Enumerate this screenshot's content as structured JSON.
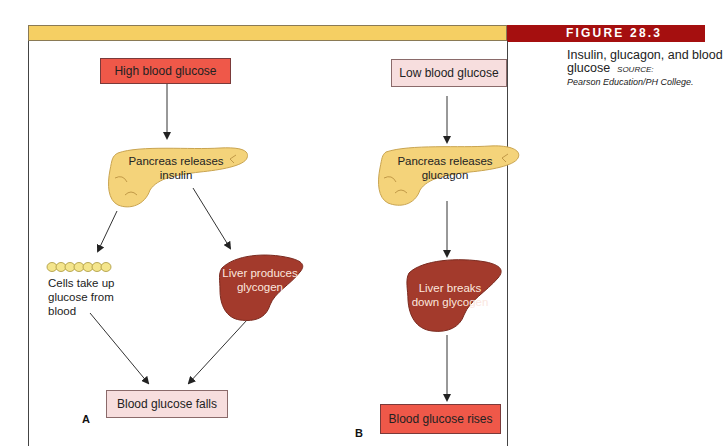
{
  "figure": {
    "number_label": "FIGURE 28.3",
    "caption_title": "Insulin, glucagon, and blood glucose",
    "caption_source_label": "SOURCE:",
    "caption_source": "Pearson Education/PH College."
  },
  "panel_a": {
    "letter": "A",
    "start": "High blood glucose",
    "pancreas": [
      "Pancreas releases",
      "insulin"
    ],
    "cells": [
      "Cells take up",
      "glucose from",
      "blood"
    ],
    "liver": [
      "Liver produces",
      "glycogen"
    ],
    "end": "Blood glucose falls"
  },
  "panel_b": {
    "letter": "B",
    "start": "Low blood glucose",
    "pancreas": [
      "Pancreas releases",
      "glucagon"
    ],
    "liver": [
      "Liver breaks",
      "down glycogen"
    ],
    "end": "Blood glucose rises"
  },
  "colors": {
    "header_yellow": "#f5cf63",
    "figure_red": "#a50f0f",
    "box_red": "#ef5849",
    "box_pink": "#f7dede",
    "pancreas_yellow": "#f4d37a",
    "liver_brown": "#a33a2c"
  }
}
